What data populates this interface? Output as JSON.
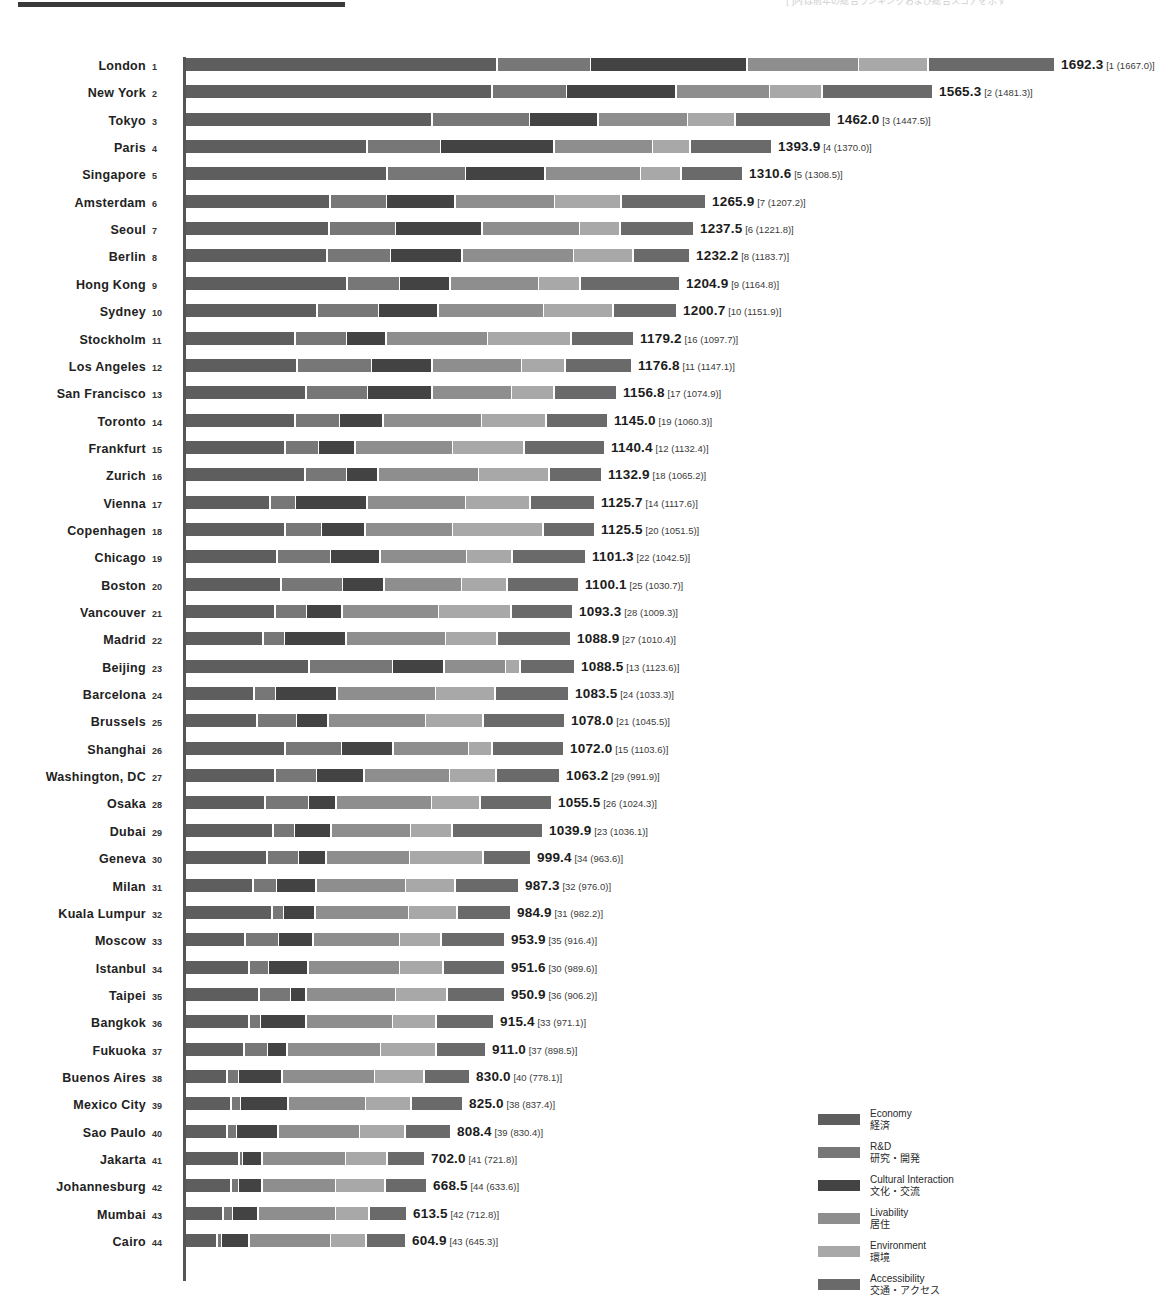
{
  "header": {
    "note": "[ ]内は前年の総合ランキングおよび総合スコアを示す"
  },
  "legend": {
    "items": [
      {
        "en": "Economy",
        "ja": "経済",
        "color": "#5e5e5e"
      },
      {
        "en": "R&D",
        "ja": "研究・開発",
        "color": "#777777"
      },
      {
        "en": "Cultural Interaction",
        "ja": "文化・交流",
        "color": "#434343"
      },
      {
        "en": "Livability",
        "ja": "居住",
        "color": "#8e8e8e"
      },
      {
        "en": "Environment",
        "ja": "環境",
        "color": "#a8a8a8"
      },
      {
        "en": "Accessibility",
        "ja": "交通・アクセス",
        "color": "#6a6a6a"
      }
    ]
  },
  "chart_data": {
    "type": "bar",
    "title": "",
    "xlabel": "",
    "ylabel": "",
    "orientation": "horizontal",
    "stacked": true,
    "grid": false,
    "legend_position": "bottom-right",
    "xlim": [
      0,
      1692.3
    ],
    "series": [
      {
        "name": "Economy",
        "color": "#5e5e5e"
      },
      {
        "name": "R&D",
        "color": "#777777"
      },
      {
        "name": "Cultural Interaction",
        "color": "#434343"
      },
      {
        "name": "Livability",
        "color": "#8e8e8e"
      },
      {
        "name": "Environment",
        "color": "#a8a8a8"
      },
      {
        "name": "Accessibility",
        "color": "#6a6a6a"
      }
    ],
    "rows": [
      {
        "rank": "1",
        "city": "London",
        "total": "1692.3",
        "prev": "[1 (1667.0)]",
        "segments": [
          310,
          92,
          155,
          110,
          68,
          125
        ]
      },
      {
        "rank": "2",
        "city": "New York",
        "total": "1565.3",
        "prev": "[2 (1481.3)]",
        "segments": [
          305,
          73,
          108,
          92,
          51,
          109
        ]
      },
      {
        "rank": "3",
        "city": "Tokyo",
        "total": "1462.0",
        "prev": "[3 (1447.5)]",
        "segments": [
          245,
          96,
          67,
          88,
          46,
          94
        ]
      },
      {
        "rank": "4",
        "city": "Paris",
        "total": "1393.9",
        "prev": "[4 (1370.0)]",
        "segments": [
          180,
          72,
          112,
          97,
          36,
          80
        ]
      },
      {
        "rank": "5",
        "city": "Singapore",
        "total": "1310.6",
        "prev": "[5 (1308.5)]",
        "segments": [
          200,
          77,
          78,
          94,
          39,
          60
        ]
      },
      {
        "rank": "6",
        "city": "Amsterdam",
        "total": "1265.9",
        "prev": "[7 (1207.2)]",
        "segments": [
          143,
          55,
          67,
          98,
          65,
          83
        ]
      },
      {
        "rank": "7",
        "city": "Seoul",
        "total": "1237.5",
        "prev": "[6 (1221.8)]",
        "segments": [
          142,
          65,
          85,
          96,
          39,
          72
        ]
      },
      {
        "rank": "8",
        "city": "Berlin",
        "total": "1232.2",
        "prev": "[8 (1183.7)]",
        "segments": [
          140,
          62,
          70,
          110,
          58,
          55
        ]
      },
      {
        "rank": "9",
        "city": "Hong Kong",
        "total": "1204.9",
        "prev": "[9 (1164.8)]",
        "segments": [
          160,
          51,
          49,
          87,
          40,
          98
        ]
      },
      {
        "rank": "10",
        "city": "Sydney",
        "total": "1200.7",
        "prev": "[10 (1151.9)]",
        "segments": [
          130,
          60,
          58,
          104,
          68,
          62
        ]
      },
      {
        "rank": "11",
        "city": "Stockholm",
        "total": "1179.2",
        "prev": "[16 (1097.7)]",
        "segments": [
          108,
          50,
          38,
          100,
          82,
          61
        ]
      },
      {
        "rank": "12",
        "city": "Los Angeles",
        "total": "1176.8",
        "prev": "[11 (1147.1)]",
        "segments": [
          110,
          73,
          59,
          88,
          42,
          65
        ]
      },
      {
        "rank": "13",
        "city": "San Francisco",
        "total": "1156.8",
        "prev": "[17 (1074.9)]",
        "segments": [
          119,
          60,
          63,
          78,
          41,
          61
        ]
      },
      {
        "rank": "14",
        "city": "Toronto",
        "total": "1145.0",
        "prev": "[19 (1060.3)]",
        "segments": [
          108,
          43,
          42,
          97,
          63,
          60
        ]
      },
      {
        "rank": "15",
        "city": "Frankfurt",
        "total": "1140.4",
        "prev": "[12 (1132.4)]",
        "segments": [
          98,
          32,
          35,
          96,
          70,
          79
        ]
      },
      {
        "rank": "16",
        "city": "Zurich",
        "total": "1132.9",
        "prev": "[18 (1065.2)]",
        "segments": [
          118,
          40,
          30,
          99,
          69,
          51
        ]
      },
      {
        "rank": "17",
        "city": "Vienna",
        "total": "1125.7",
        "prev": "[14 (1117.6)]",
        "segments": [
          83,
          24,
          70,
          97,
          63,
          63
        ]
      },
      {
        "rank": "18",
        "city": "Copenhagen",
        "total": "1125.5",
        "prev": "[20 (1051.5)]",
        "segments": [
          98,
          35,
          42,
          86,
          89,
          50
        ]
      },
      {
        "rank": "19",
        "city": "Chicago",
        "total": "1101.3",
        "prev": "[22 (1042.5)]",
        "segments": [
          90,
          52,
          48,
          85,
          44,
          72
        ]
      },
      {
        "rank": "20",
        "city": "Boston",
        "total": "1100.1",
        "prev": "[25 (1030.7)]",
        "segments": [
          94,
          60,
          40,
          76,
          44,
          70
        ]
      },
      {
        "rank": "21",
        "city": "Vancouver",
        "total": "1093.3",
        "prev": "[28 (1009.3)]",
        "segments": [
          88,
          30,
          34,
          95,
          71,
          60
        ]
      },
      {
        "rank": "22",
        "city": "Madrid",
        "total": "1088.9",
        "prev": "[27 (1010.4)]",
        "segments": [
          76,
          20,
          60,
          98,
          50,
          72
        ]
      },
      {
        "rank": "23",
        "city": "Beijing",
        "total": "1088.5",
        "prev": "[13 (1123.6)]",
        "segments": [
          122,
          82,
          50,
          60,
          13,
          53
        ]
      },
      {
        "rank": "24",
        "city": "Barcelona",
        "total": "1083.5",
        "prev": "[24 (1033.3)]",
        "segments": [
          67,
          20,
          60,
          97,
          58,
          72
        ]
      },
      {
        "rank": "25",
        "city": "Brussels",
        "total": "1078.0",
        "prev": "[21 (1045.5)]",
        "segments": [
          70,
          38,
          30,
          96,
          56,
          80
        ]
      },
      {
        "rank": "26",
        "city": "Shanghai",
        "total": "1072.0",
        "prev": "[15 (1103.6)]",
        "segments": [
          98,
          55,
          50,
          74,
          22,
          70
        ]
      },
      {
        "rank": "27",
        "city": "Washington, DC",
        "total": "1063.2",
        "prev": "[29 (991.9)]",
        "segments": [
          88,
          40,
          46,
          84,
          45,
          62
        ]
      },
      {
        "rank": "28",
        "city": "Osaka",
        "total": "1055.5",
        "prev": "[26 (1024.3)]",
        "segments": [
          78,
          42,
          26,
          94,
          47,
          70
        ]
      },
      {
        "rank": "29",
        "city": "Dubai",
        "total": "1039.9",
        "prev": "[23 (1036.1)]",
        "segments": [
          86,
          20,
          35,
          78,
          40,
          89
        ]
      },
      {
        "rank": "30",
        "city": "Geneva",
        "total": "999.4",
        "prev": "[34 (963.6)]",
        "segments": [
          80,
          30,
          26,
          82,
          72,
          46
        ]
      },
      {
        "rank": "31",
        "city": "Milan",
        "total": "987.3",
        "prev": "[32 (976.0)]",
        "segments": [
          66,
          22,
          38,
          88,
          48,
          62
        ]
      },
      {
        "rank": "32",
        "city": "Kuala Lumpur",
        "total": "984.9",
        "prev": "[31 (982.2)]",
        "segments": [
          85,
          10,
          30,
          92,
          47,
          52
        ]
      },
      {
        "rank": "33",
        "city": "Moscow",
        "total": "953.9",
        "prev": "[35 (916.4)]",
        "segments": [
          58,
          32,
          33,
          85,
          40,
          62
        ]
      },
      {
        "rank": "34",
        "city": "Istanbul",
        "total": "951.6",
        "prev": "[30 (989.6)]",
        "segments": [
          62,
          18,
          38,
          90,
          42,
          60
        ]
      },
      {
        "rank": "35",
        "city": "Taipei",
        "total": "950.9",
        "prev": "[36 (906.2)]",
        "segments": [
          72,
          30,
          14,
          88,
          50,
          56
        ]
      },
      {
        "rank": "36",
        "city": "Bangkok",
        "total": "915.4",
        "prev": "[33 (971.1)]",
        "segments": [
          62,
          10,
          44,
          85,
          42,
          56
        ]
      },
      {
        "rank": "37",
        "city": "Fukuoka",
        "total": "911.0",
        "prev": "[37 (898.5)]",
        "segments": [
          57,
          22,
          18,
          92,
          54,
          48
        ]
      },
      {
        "rank": "38",
        "city": "Buenos Aires",
        "total": "830.0",
        "prev": "[40 (778.1)]",
        "segments": [
          40,
          10,
          42,
          91,
          48,
          44
        ]
      },
      {
        "rank": "39",
        "city": "Mexico City",
        "total": "825.0",
        "prev": "[38 (837.4)]",
        "segments": [
          44,
          8,
          46,
          76,
          44,
          50
        ]
      },
      {
        "rank": "40",
        "city": "Sao Paulo",
        "total": "808.4",
        "prev": "[39 (830.4)]",
        "segments": [
          40,
          8,
          40,
          80,
          44,
          44
        ]
      },
      {
        "rank": "41",
        "city": "Jakarta",
        "total": "702.0",
        "prev": "[41 (721.8)]",
        "segments": [
          52,
          2,
          18,
          82,
          40,
          36
        ]
      },
      {
        "rank": "42",
        "city": "Johannesburg",
        "total": "668.5",
        "prev": "[44 (633.6)]",
        "segments": [
          44,
          6,
          22,
          72,
          48,
          40
        ]
      },
      {
        "rank": "43",
        "city": "Mumbai",
        "total": "613.5",
        "prev": "[42 (712.8)]",
        "segments": [
          36,
          8,
          24,
          76,
          32,
          36
        ]
      },
      {
        "rank": "44",
        "city": "Cairo",
        "total": "604.9",
        "prev": "[43 (645.3)]",
        "segments": [
          30,
          3,
          26,
          80,
          34,
          38
        ]
      }
    ]
  }
}
